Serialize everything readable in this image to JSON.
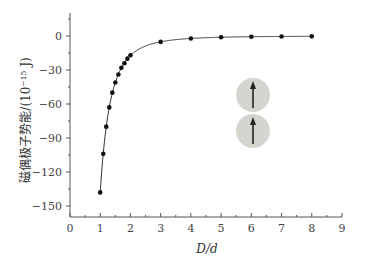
{
  "chart_data": {
    "type": "line",
    "title": "",
    "xlabel": "D/d",
    "ylabel": "磁偶极子势能/(10⁻¹⁵ J)",
    "xlim": [
      0,
      9
    ],
    "ylim": [
      -159,
      20
    ],
    "x_ticks": [
      0,
      1,
      2,
      3,
      4,
      5,
      6,
      7,
      8,
      9
    ],
    "y_ticks": [
      0,
      -30,
      -60,
      -90,
      -120,
      -150
    ],
    "grid": false,
    "legend": null,
    "series": [
      {
        "name": "magnetic dipole potential energy",
        "marker": "circle",
        "x": [
          1.0,
          1.1,
          1.2,
          1.3,
          1.4,
          1.5,
          1.6,
          1.7,
          1.8,
          1.9,
          2.0,
          3,
          4,
          5,
          6,
          7,
          8
        ],
        "y": [
          -138,
          -104,
          -80,
          -63,
          -50,
          -41,
          -34,
          -28,
          -24,
          -20,
          -17,
          -5.2,
          -2.2,
          -1.1,
          -0.7,
          -0.4,
          -0.3
        ]
      }
    ],
    "annotations": [
      {
        "type": "inset-image",
        "description": "two gray spheres each with an upward arrow (aligned dipoles)",
        "count": 2
      }
    ]
  },
  "inset": {
    "circle_color": "#d3d5ce",
    "arrow_color": "#222222",
    "arrow_direction": "up"
  }
}
